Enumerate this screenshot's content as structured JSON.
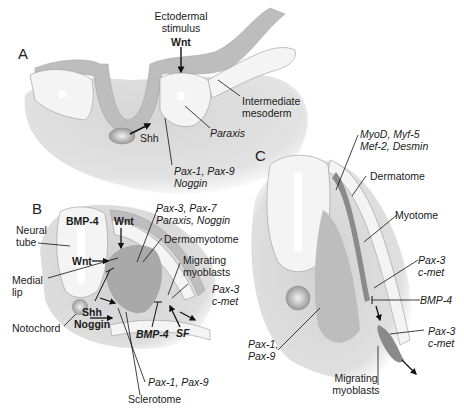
{
  "panels": {
    "A": {
      "letter": "A",
      "labels": {
        "ectodermal_stimulus_1": "Ectodermal",
        "ectodermal_stimulus_2": "stimulus",
        "wnt": "Wnt",
        "intermediate_1": "Intermediate",
        "intermediate_2": "mesoderm",
        "paraxis": "Paraxis",
        "shh": "Shh",
        "pax_1": "Pax-1, Pax-9",
        "pax_2": "Noggin"
      }
    },
    "B": {
      "letter": "B",
      "labels": {
        "bmp4_top": "BMP-4",
        "wnt_top": "Wnt",
        "neural_tube_1": "Neural",
        "neural_tube_2": "tube",
        "wnt_mid": "Wnt",
        "pax37_1": "Pax-3, Pax-7",
        "pax37_2": "Paraxis, Noggin",
        "dermomyotome": "Dermomyotome",
        "medial_lip_1": "Medial",
        "medial_lip_2": "lip",
        "migrating_1": "Migrating",
        "migrating_2": "myoblasts",
        "pax3_1": "Pax-3",
        "pax3_2": "c-met",
        "notochord": "Notochord",
        "shh": "Shh",
        "noggin": "Noggin",
        "bmp4_bottom": "BMP-4",
        "sf": "SF",
        "pax19": "Pax-1, Pax-9",
        "sclerotome": "Sclerotome"
      }
    },
    "C": {
      "letter": "C",
      "labels": {
        "myod_1": "MyoD, Myf-5",
        "myod_2": "Mef-2, Desmin",
        "dermatome": "Dermatome",
        "myotome": "Myotome",
        "pax3a_1": "Pax-3",
        "pax3a_2": "c-met",
        "bmp4": "BMP-4",
        "pax3b_1": "Pax-3",
        "pax3b_2": "c-met",
        "pax19_1": "Pax-1,",
        "pax19_2": "Pax-9",
        "migrating_1": "Migrating",
        "migrating_2": "myoblasts"
      }
    }
  },
  "colors": {
    "mesenchyme": "#dcdcdc",
    "epithelium": "#f4f4f4",
    "ectoderm": "#b9b9b9",
    "sclerotome": "#a9a9a9",
    "myotome": "#8a8a8a",
    "line": "#1a1a1a"
  }
}
